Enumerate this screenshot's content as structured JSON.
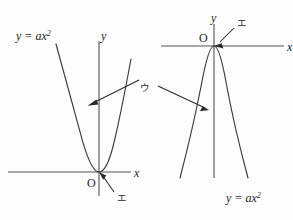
{
  "figure": {
    "background_color": "#fdfdfd",
    "ink_color": "#2b2b2b",
    "axis_color": "#555555",
    "curve_color": "#3a3a3a"
  },
  "left_diagram": {
    "equation_label": "y = ax",
    "equation_exponent": "2",
    "y_axis_label": "y",
    "x_axis_label": "x",
    "origin_label": "O",
    "vertex_callout": "エ",
    "curve_callout": "ウ",
    "opening": "upward"
  },
  "right_diagram": {
    "equation_label": "y = ax",
    "equation_exponent": "2",
    "y_axis_label": "y",
    "x_axis_label": "x",
    "origin_label": "O",
    "vertex_callout": "エ",
    "curve_callout": "ウ",
    "opening": "downward"
  },
  "shared_callout": {
    "label": "ウ"
  }
}
